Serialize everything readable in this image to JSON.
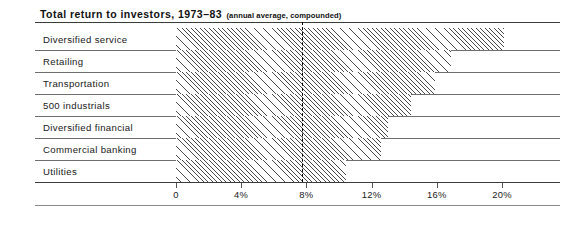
{
  "chart_data": {
    "type": "bar",
    "orientation": "horizontal",
    "title": "Total return to investors, 1973–83",
    "subtitle": "(annual average, compounded)",
    "categories": [
      "Diversified service",
      "Retailing",
      "Transportation",
      "500 industrials",
      "Diversified financial",
      "Commercial banking",
      "Utilities"
    ],
    "values": [
      20.1,
      16.9,
      15.9,
      14.4,
      13.0,
      12.6,
      10.4
    ],
    "xlabel": "",
    "ylabel": "",
    "xlim": [
      0,
      21.5
    ],
    "xticks": [
      0,
      4,
      8,
      12,
      16,
      20
    ],
    "xticklabels": [
      "0",
      "4%",
      "8%",
      "12%",
      "16%",
      "20%"
    ],
    "grid": false,
    "legend": null,
    "reference_line": {
      "value": 7.7,
      "style": "dashed",
      "color": "#000000"
    },
    "bar_fill": "diagonal-hatch",
    "bar_colors": {
      "hatch": "#4a4a4a",
      "background": "#ffffff"
    }
  }
}
